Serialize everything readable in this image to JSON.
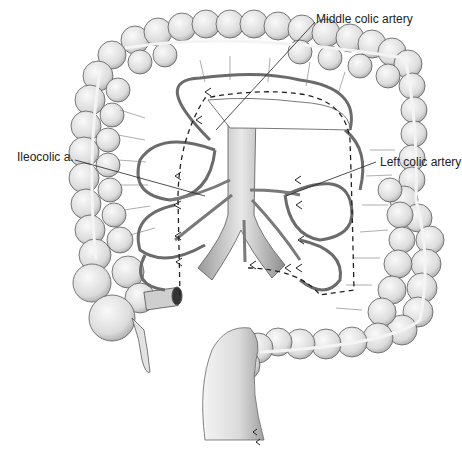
{
  "figure": {
    "labels": {
      "middle_colic": "Middle colic artery",
      "ileocolic": "Ileocolic a.",
      "left_colic": "Left colic artery"
    },
    "colors": {
      "background": "#ffffff",
      "line": "#444444",
      "fill_light": "#e6e6e6",
      "fill_mid": "#cfcfcf",
      "vessel": "#8a8a8a"
    }
  }
}
